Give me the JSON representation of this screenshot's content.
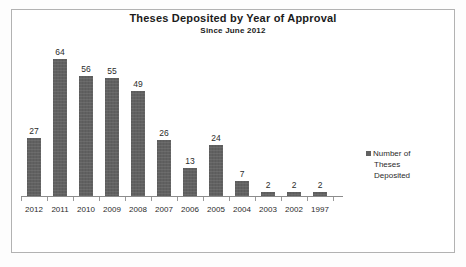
{
  "chart_data": {
    "type": "bar",
    "title": "Theses Deposited by Year of Approval",
    "subtitle": "Since June 2012",
    "categories": [
      "2012",
      "2011",
      "2010",
      "2009",
      "2008",
      "2007",
      "2006",
      "2005",
      "2004",
      "2003",
      "2002",
      "1997"
    ],
    "values": [
      27,
      64,
      56,
      55,
      49,
      26,
      13,
      24,
      7,
      2,
      2,
      2
    ],
    "series": [
      {
        "name": "Number of Theses Deposited",
        "values": [
          27,
          64,
          56,
          55,
          49,
          26,
          13,
          24,
          7,
          2,
          2,
          2
        ]
      }
    ],
    "xlabel": "",
    "ylabel": "",
    "ylim": [
      0,
      70
    ],
    "grid": false,
    "legend_position": "right",
    "data_labels": true,
    "bar_color": "#616161",
    "text_color": "#2b2b2b",
    "frame_color": "#b2b2b2",
    "axis_color": "#8c8c8c"
  },
  "legend": {
    "marker": "square-marker",
    "label_lines": [
      "Number of",
      "Theses",
      "Deposited"
    ],
    "label": "Number of Theses Deposited"
  }
}
